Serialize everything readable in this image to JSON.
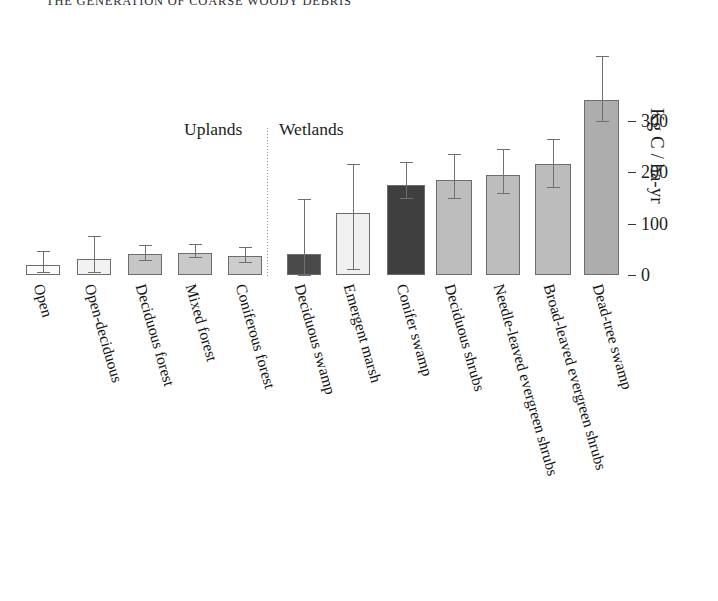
{
  "running_head": {
    "text": "THE GENERATION OF COARSE WOODY DEBRIS",
    "visible": "partially cropped at top edge"
  },
  "chart_data": {
    "type": "bar",
    "title": "",
    "xlabel": "",
    "ylabel": "Kg C / ha-yr",
    "ylim": [
      0,
      430
    ],
    "yticks": [
      0,
      100,
      200,
      300
    ],
    "ytick_labels": [
      "0",
      "100",
      "200",
      "300"
    ],
    "grid": false,
    "legend": "none",
    "group_labels": [
      "Uplands",
      "Wetlands"
    ],
    "group_divider": true,
    "categories": [
      "Open",
      "Open-deciduous",
      "Deciduous forest",
      "Mixed forest",
      "Coniferous forest",
      "Deciduous swamp",
      "Emergent marsh",
      "Conifer swamp",
      "Deciduous shrubs",
      "Needle-leaved evergreen shrubs",
      "Broad-leaved evergreen shrubs",
      "Dead-tree swamp"
    ],
    "groups": [
      "Uplands",
      "Uplands",
      "Uplands",
      "Uplands",
      "Uplands",
      "Wetlands",
      "Wetlands",
      "Wetlands",
      "Wetlands",
      "Wetlands",
      "Wetlands",
      "Wetlands"
    ],
    "values": [
      20,
      31,
      40,
      42,
      36,
      40,
      120,
      175,
      185,
      195,
      215,
      340
    ],
    "error_upper": [
      47,
      76,
      58,
      60,
      55,
      148,
      215,
      220,
      235,
      245,
      265,
      425
    ],
    "error_lower": [
      6,
      6,
      30,
      34,
      26,
      0,
      12,
      150,
      150,
      160,
      170,
      300
    ],
    "bar_colors": [
      "#fbfbfb",
      "#f2f2f2",
      "#c6c6c6",
      "#c9c9c9",
      "#cdcdcd",
      "#4a4a4a",
      "#f0f0f0",
      "#3f3f3f",
      "#bdbdbd",
      "#bdbdbd",
      "#bcbcbc",
      "#adadad"
    ],
    "bar_border_color": "#6d6d6d",
    "error_bar_color": "#6f6f6f"
  },
  "bars": [
    {
      "label": "Open",
      "value": 20,
      "err_hi": 47,
      "err_lo": 6,
      "left": 26,
      "width": 34,
      "color": "#fbfbfb"
    },
    {
      "label": "Open-deciduous",
      "value": 31,
      "err_hi": 76,
      "err_lo": 6,
      "left": 77,
      "width": 34,
      "color": "#f2f2f2"
    },
    {
      "label": "Deciduous forest",
      "value": 40,
      "err_hi": 58,
      "err_lo": 30,
      "left": 128,
      "width": 34,
      "color": "#c6c6c6"
    },
    {
      "label": "Mixed forest",
      "value": 42,
      "err_hi": 60,
      "err_lo": 34,
      "left": 178,
      "width": 34,
      "color": "#c9c9c9"
    },
    {
      "label": "Coniferous forest",
      "value": 36,
      "err_hi": 55,
      "err_lo": 26,
      "left": 228,
      "width": 34,
      "color": "#cdcdcd"
    },
    {
      "label": "Deciduous swamp",
      "value": 40,
      "err_hi": 148,
      "err_lo": 0,
      "left": 287,
      "width": 34,
      "color": "#4a4a4a"
    },
    {
      "label": "Emergent marsh",
      "value": 120,
      "err_hi": 215,
      "err_lo": 12,
      "left": 336,
      "width": 34,
      "color": "#f0f0f0"
    },
    {
      "label": "Conifer swamp",
      "value": 175,
      "err_hi": 220,
      "err_lo": 150,
      "left": 387,
      "width": 38,
      "color": "#3f3f3f"
    },
    {
      "label": "Deciduous shrubs",
      "value": 185,
      "err_hi": 235,
      "err_lo": 150,
      "left": 436,
      "width": 36,
      "color": "#bdbdbd"
    },
    {
      "label": "Needle-leaved evergreen shrubs",
      "value": 195,
      "err_hi": 245,
      "err_lo": 160,
      "left": 486,
      "width": 34,
      "color": "#bdbdbd"
    },
    {
      "label": "Broad-leaved evergreen shrubs",
      "value": 215,
      "err_hi": 265,
      "err_lo": 170,
      "left": 535,
      "width": 36,
      "color": "#bcbcbc"
    },
    {
      "label": "Dead-tree swamp",
      "value": 340,
      "err_hi": 425,
      "err_lo": 300,
      "left": 584,
      "width": 35,
      "color": "#adadad"
    }
  ],
  "axis": {
    "y_title": "Kg C / ha-yr",
    "ticks": [
      {
        "label": "300",
        "value": 300
      },
      {
        "label": "200",
        "value": 200
      },
      {
        "label": "100",
        "value": 100
      },
      {
        "label": "0",
        "value": 0
      }
    ]
  },
  "groups": {
    "uplands_label": "Uplands",
    "wetlands_label": "Wetlands"
  },
  "colors": {
    "background": "#ffffff",
    "ink": "#1a1a1a",
    "bar_outline": "#6d6d6d",
    "error_bar": "#6f6f6f",
    "divider": "#9a9a9a"
  }
}
